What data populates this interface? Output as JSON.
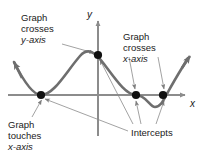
{
  "figure": {
    "kind": "polynomial-graph-annotation-diagram",
    "background_color": "#ffffff",
    "curve_color": "#6e6e6e",
    "axis_color": "#8c8c8c",
    "point_color": "#111111",
    "leader_color": "#8a8a8a",
    "text_color": "#1a1a1a"
  },
  "axes": {
    "x_label": "x",
    "y_label": "y",
    "x_axis_y_px": 95,
    "y_axis_x_px": 98,
    "x_axis_from_px": 8,
    "x_axis_to_px": 188,
    "y_axis_from_px": 18,
    "y_axis_to_px": 136
  },
  "annotations": [
    {
      "id": "crosses-y-axis",
      "lines": [
        "Graph",
        "crosses",
        "y-axis"
      ],
      "italic_line_index": 2,
      "target_point": "y-intercept"
    },
    {
      "id": "crosses-x-axis",
      "lines": [
        "Graph",
        "crosses",
        "x-axis"
      ],
      "italic_line_index": 2,
      "target_point": "x-intercept-right-pair"
    },
    {
      "id": "touches-x-axis",
      "lines": [
        "Graph",
        "touches",
        "x-axis"
      ],
      "italic_line_index": 2,
      "target_point": "x-intercept-tangent"
    },
    {
      "id": "intercepts",
      "lines": [
        "Intercepts"
      ],
      "italic_line_index": -1,
      "target_point": "all-intercepts"
    }
  ],
  "marked_points": [
    {
      "name": "x-intercept-tangent",
      "x_px": 41,
      "y_px": 95,
      "type": "touch"
    },
    {
      "name": "y-intercept",
      "x_px": 98,
      "y_px": 55,
      "type": "cross"
    },
    {
      "name": "x-intercept-left-of-pair",
      "x_px": 136,
      "y_px": 95,
      "type": "cross"
    },
    {
      "name": "x-intercept-right-of-pair",
      "x_px": 163,
      "y_px": 95,
      "type": "cross"
    }
  ],
  "curve": {
    "description": "quartic-like curve: arrow up-left, dips to touch x-axis, rises to local max near y-axis, falls crossing x-axis, local min below axis, rises crossing x-axis, arrow up-right",
    "path": "M 14,62 C 22,78 32,95 41,95 C 54,95 66,72 80,56 C 88,47 95,52 104,64 C 116,80 126,95 136,95 C 146,95 150,107 155,107 C 161,107 164,99 168,92 C 175,79 182,68 188,58",
    "start_arrow": "up-left",
    "end_arrow": "up-right"
  }
}
